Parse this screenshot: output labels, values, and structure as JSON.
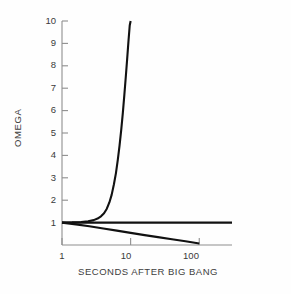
{
  "chart_data": {
    "type": "line",
    "title": "",
    "subtitle": "",
    "xlabel": "SECONDS AFTER BIG BANG",
    "ylabel": "OMEGA",
    "xscale": "log",
    "yscale": "linear",
    "xlim": [
      1,
      300
    ],
    "ylim": [
      0,
      10
    ],
    "grid": false,
    "legend": "none",
    "xticks": [
      {
        "value": 1,
        "label": "1"
      },
      {
        "value": 10,
        "label": "10"
      },
      {
        "value": 100,
        "label": "100"
      }
    ],
    "yticks": [
      {
        "value": 1,
        "label": "1"
      },
      {
        "value": 2,
        "label": "2"
      },
      {
        "value": 3,
        "label": "3"
      },
      {
        "value": 4,
        "label": "4"
      },
      {
        "value": 5,
        "label": "5"
      },
      {
        "value": 6,
        "label": "6"
      },
      {
        "value": 7,
        "label": "7"
      },
      {
        "value": 8,
        "label": "8"
      },
      {
        "value": 9,
        "label": "9"
      },
      {
        "value": 10,
        "label": "10"
      }
    ],
    "annotations": [],
    "series": [
      {
        "name": "closed-universe-diverging-above",
        "color": "#111111",
        "points": [
          [
            1.0,
            1.0
          ],
          [
            1.4,
            1.01
          ],
          [
            1.9,
            1.03
          ],
          [
            2.4,
            1.06
          ],
          [
            2.9,
            1.11
          ],
          [
            3.3,
            1.18
          ],
          [
            3.7,
            1.28
          ],
          [
            4.1,
            1.42
          ],
          [
            4.5,
            1.62
          ],
          [
            4.9,
            1.9
          ],
          [
            5.3,
            2.25
          ],
          [
            5.7,
            2.7
          ],
          [
            6.1,
            3.2
          ],
          [
            6.5,
            3.8
          ],
          [
            6.9,
            4.45
          ],
          [
            7.3,
            5.15
          ],
          [
            7.7,
            5.9
          ],
          [
            8.1,
            6.7
          ],
          [
            8.5,
            7.5
          ],
          [
            8.9,
            8.3
          ],
          [
            9.3,
            9.1
          ],
          [
            9.7,
            9.8
          ],
          [
            10.0,
            10.0
          ]
        ]
      },
      {
        "name": "flat-universe-critical-density",
        "color": "#111111",
        "points": [
          [
            1.0,
            1.0
          ],
          [
            300.0,
            1.0
          ]
        ]
      },
      {
        "name": "open-universe-diverging-below",
        "color": "#111111",
        "points": [
          [
            1.0,
            1.0
          ],
          [
            1.6,
            0.92
          ],
          [
            2.5,
            0.84
          ],
          [
            4.0,
            0.74
          ],
          [
            6.3,
            0.64
          ],
          [
            10.0,
            0.54
          ],
          [
            16.0,
            0.44
          ],
          [
            25.0,
            0.35
          ],
          [
            40.0,
            0.26
          ],
          [
            63.0,
            0.17
          ],
          [
            100.0,
            0.07
          ]
        ]
      }
    ]
  },
  "axes": {
    "spine_color": "#8e8e8e",
    "tick_color": "#8e8e8e",
    "line_color": "#111111",
    "background": "#fefefe"
  }
}
